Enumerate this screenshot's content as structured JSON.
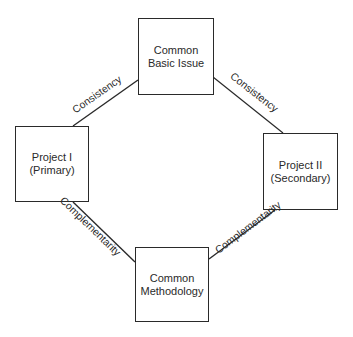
{
  "diagram": {
    "nodes": {
      "top": {
        "line1": "Common",
        "line2": "Basic Issue"
      },
      "left": {
        "line1": "Project I",
        "line2": "(Primary)"
      },
      "right": {
        "line1": "Project II",
        "line2": "(Secondary)"
      },
      "bottom": {
        "line1": "Common",
        "line2": "Methodology"
      }
    },
    "edges": {
      "top_left": "Consistency",
      "top_right": "Consistency",
      "left_bottom": "Complementarity",
      "right_bottom": "Complementarity"
    },
    "colors": {
      "stroke": "#2a2a2a",
      "background": "#ffffff"
    }
  }
}
